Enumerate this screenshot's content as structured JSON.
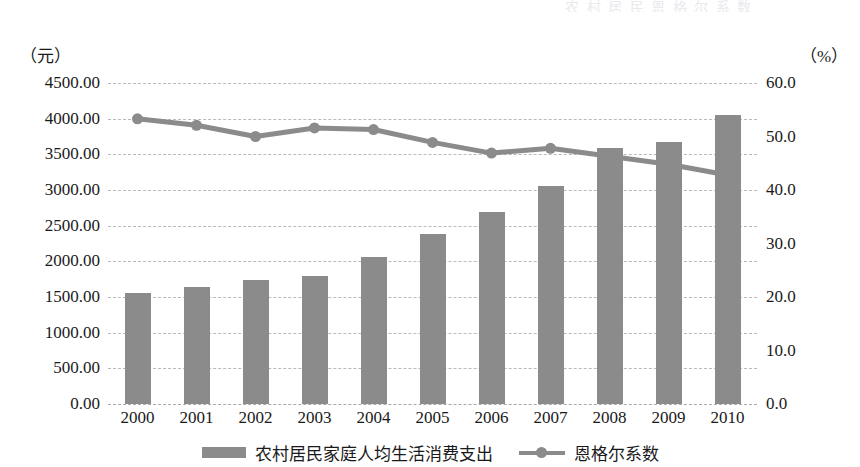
{
  "ghost_header_text": "农 村 居 民 恩 格 尔 系 数",
  "axis": {
    "left_unit": "（元）",
    "right_unit": "（%）",
    "left_ticks": [
      "0.00",
      "500.00",
      "1000.00",
      "1500.00",
      "2000.00",
      "2500.00",
      "3000.00",
      "3500.00",
      "4000.00",
      "4500.00"
    ],
    "right_ticks": [
      "0.0",
      "10.0",
      "20.0",
      "30.0",
      "40.0",
      "50.0",
      "60.0"
    ]
  },
  "legend": {
    "bar_label": "农村居民家庭人均生活消费支出",
    "line_label": "恩格尔系数"
  },
  "colors": {
    "bar": "#8b8b8b",
    "line": "#8b8b8b",
    "grid": "#b9b9bf",
    "text": "#1a1a1a",
    "background": "#ffffff"
  },
  "chart_data": {
    "type": "bar",
    "title": "",
    "subtitle": "",
    "xlabel": "",
    "ylabel": "（元）",
    "y2label": "（%）",
    "grid": true,
    "legend_position": "bottom",
    "categories": [
      "2000",
      "2001",
      "2002",
      "2003",
      "2004",
      "2005",
      "2006",
      "2007",
      "2008",
      "2009",
      "2010"
    ],
    "ylim": [
      0,
      4500
    ],
    "y2lim": [
      0,
      60
    ],
    "ytick_step": 500,
    "y2tick_step": 10,
    "series": [
      {
        "name": "农村居民家庭人均生活消费支出",
        "type": "bar",
        "axis": "left",
        "unit": "元",
        "values": [
          1550,
          1640,
          1740,
          1790,
          2060,
          2390,
          2690,
          3050,
          3590,
          3670,
          4050
        ]
      },
      {
        "name": "恩格尔系数",
        "type": "line",
        "axis": "right",
        "unit": "%",
        "values": [
          53.3,
          52.1,
          50.0,
          51.6,
          51.3,
          48.9,
          46.9,
          47.8,
          46.3,
          44.8,
          42.8
        ]
      }
    ]
  }
}
